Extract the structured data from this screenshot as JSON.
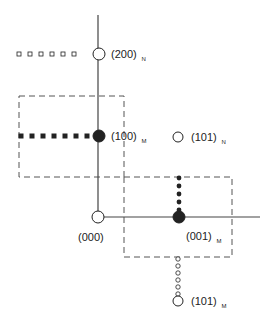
{
  "diagram": {
    "colors": {
      "ink": "#222222",
      "axis": "#444444",
      "dash": "#555555"
    },
    "axes": {
      "vertical": {
        "x": 98,
        "y1": 15,
        "y2": 217
      },
      "horizontal": {
        "y": 217,
        "x1": 98,
        "x2": 260
      }
    },
    "boxes": [
      {
        "name": "upper-left-cell",
        "x": 19,
        "y": 96,
        "w": 105,
        "h": 81
      },
      {
        "name": "lower-right-cell",
        "x": 124,
        "y": 177,
        "w": 108,
        "h": 80
      }
    ],
    "points": [
      {
        "id": "p000",
        "label": "(000)",
        "sub": "",
        "x": 98,
        "y": 217,
        "r": 6,
        "filled": false,
        "label_x": 78,
        "label_y": 241
      },
      {
        "id": "p200N",
        "label": "(200)",
        "sub": "N",
        "x": 99,
        "y": 54,
        "r": 6,
        "filled": false,
        "label_x": 111,
        "label_y": 58
      },
      {
        "id": "p100M",
        "label": "(100)",
        "sub": "M",
        "x": 99,
        "y": 136,
        "r": 6,
        "filled": true,
        "label_x": 111,
        "label_y": 140
      },
      {
        "id": "p101N",
        "label": "(101)",
        "sub": "N",
        "x": 178,
        "y": 137,
        "r": 5,
        "filled": false,
        "label_x": 191,
        "label_y": 141
      },
      {
        "id": "p001M",
        "label": "(001)",
        "sub": "M",
        "x": 179,
        "y": 217,
        "r": 6,
        "filled": true,
        "label_x": 186,
        "label_y": 240
      },
      {
        "id": "p101M",
        "label": "(101)",
        "sub": "M",
        "x": 178,
        "y": 301,
        "r": 5,
        "filled": false,
        "label_x": 191,
        "label_y": 305
      }
    ],
    "tracks": [
      {
        "name": "open-square-track",
        "shape": "square",
        "filled": false,
        "coords": [
          [
            19,
            54
          ],
          [
            30,
            54
          ],
          [
            41,
            54
          ],
          [
            52,
            54
          ],
          [
            63,
            54
          ],
          [
            74,
            54
          ]
        ]
      },
      {
        "name": "filled-square-track",
        "shape": "square",
        "filled": true,
        "coords": [
          [
            21,
            136
          ],
          [
            32,
            136
          ],
          [
            43,
            136
          ],
          [
            54,
            136
          ],
          [
            65,
            136
          ],
          [
            76,
            136
          ],
          [
            87,
            136
          ]
        ]
      },
      {
        "name": "filled-dot-track",
        "shape": "dot",
        "filled": true,
        "coords": [
          [
            179,
            178
          ],
          [
            179,
            186
          ],
          [
            179,
            194
          ],
          [
            179,
            202
          ],
          [
            179,
            210
          ]
        ]
      },
      {
        "name": "open-dot-track",
        "shape": "dot",
        "filled": false,
        "coords": [
          [
            178,
            259
          ],
          [
            178,
            266
          ],
          [
            178,
            273
          ],
          [
            178,
            280
          ],
          [
            178,
            287
          ],
          [
            178,
            294
          ]
        ]
      }
    ]
  }
}
